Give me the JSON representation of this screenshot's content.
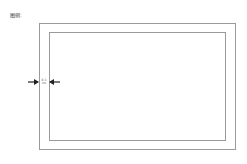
{
  "legend": {
    "label": "图例:"
  },
  "diagram": {
    "dimension": {
      "value": "0.3",
      "unit": "cm"
    },
    "stroke_color": "#9a9a9a",
    "arrow_color": "#222222"
  }
}
